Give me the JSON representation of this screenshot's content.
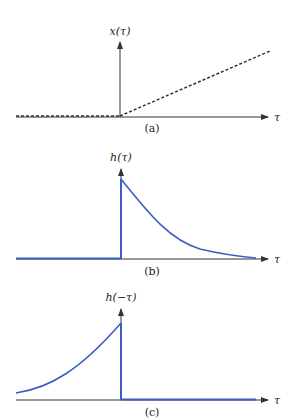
{
  "colors": {
    "axis": "#333333",
    "curve": "#3a5fc0",
    "dashed": "#333333",
    "background": "#ffffff"
  },
  "panels": [
    {
      "id": "a",
      "y_label": "x(τ)",
      "x_label": "τ",
      "caption": "(a)",
      "description": "ramp: zero for τ<0 (dashed along axis), linear increase for τ>0 (dashed)"
    },
    {
      "id": "b",
      "y_label": "h(τ)",
      "x_label": "τ",
      "caption": "(b)",
      "description": "zero for τ<0, jump at τ=0, decaying exponential for τ>0"
    },
    {
      "id": "c",
      "y_label": "h(−τ)",
      "x_label": "τ",
      "caption": "(c)",
      "description": "time-reversed: rising exponential for τ<0, drop to zero at τ=0, zero for τ>0"
    }
  ]
}
